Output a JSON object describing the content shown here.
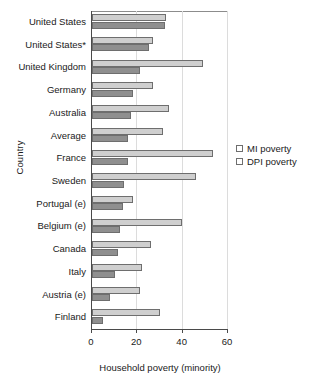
{
  "chart_data": {
    "type": "bar",
    "orientation": "horizontal",
    "title": "",
    "xlabel": "Household poverty (minority)",
    "ylabel": "Country",
    "xlim": [
      0,
      60
    ],
    "xticks": [
      0,
      20,
      40,
      60
    ],
    "grid": true,
    "legend_position": "right",
    "categories": [
      "United States",
      "United States*",
      "United Kingdom",
      "Germany",
      "Australia",
      "Average",
      "France",
      "Sweden",
      "Portugal (e)",
      "Belgium (e)",
      "Canada",
      "Italy",
      "Austria (e)",
      "Finland"
    ],
    "series": [
      {
        "name": "MI poverty",
        "color": "#cfcfcf",
        "values": [
          32.5,
          27.0,
          49.0,
          27.0,
          34.0,
          31.5,
          53.5,
          46.0,
          18.0,
          39.5,
          26.0,
          22.0,
          21.0,
          30.0
        ]
      },
      {
        "name": "DPI poverty",
        "color": "#8f8f8f",
        "values": [
          32.0,
          25.0,
          21.0,
          18.0,
          17.0,
          16.0,
          16.0,
          14.0,
          13.5,
          12.5,
          11.5,
          10.0,
          8.0,
          5.0
        ]
      }
    ]
  },
  "legend": {
    "entries": [
      {
        "label": "MI poverty"
      },
      {
        "label": "DPI poverty"
      }
    ]
  }
}
